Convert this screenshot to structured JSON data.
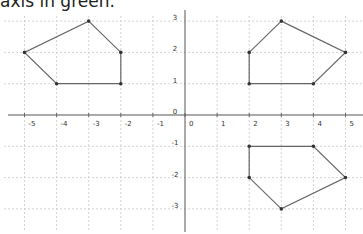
{
  "caption": "axis in green.",
  "graph": {
    "x_ticks": [
      -5,
      -4,
      -3,
      -2,
      -1,
      0,
      1,
      2,
      3,
      4,
      5
    ],
    "y_ticks": [
      3,
      2,
      1,
      0,
      -1,
      -2,
      -3
    ],
    "origin_label": "0",
    "colors": {
      "axis": "#555555",
      "grid": "#c8c8c8",
      "shape": "#666666",
      "vertex": "#333333"
    }
  },
  "shapes": [
    {
      "name": "pentagon-original",
      "points": [
        [
          -3,
          3
        ],
        [
          -2,
          2
        ],
        [
          -2,
          1
        ],
        [
          -4,
          1
        ],
        [
          -5,
          2
        ]
      ]
    },
    {
      "name": "pentagon-reflected-y-axis",
      "points": [
        [
          3,
          3
        ],
        [
          5,
          2
        ],
        [
          4,
          1
        ],
        [
          2,
          1
        ],
        [
          2,
          2
        ]
      ]
    },
    {
      "name": "pentagon-reflected-x-axis",
      "points": [
        [
          2,
          -1
        ],
        [
          4,
          -1
        ],
        [
          5,
          -2
        ],
        [
          3,
          -3
        ],
        [
          2,
          -2
        ]
      ]
    }
  ]
}
